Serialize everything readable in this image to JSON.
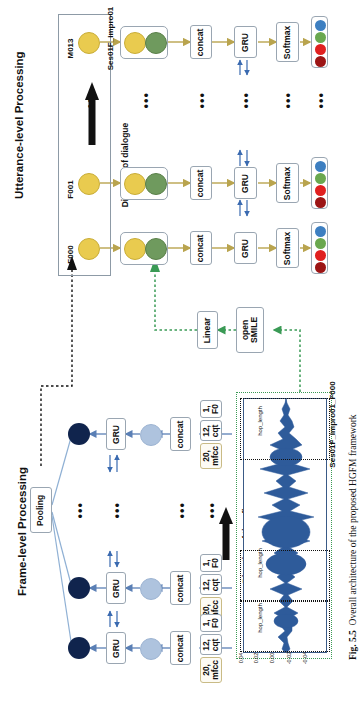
{
  "figure": {
    "caption_number": "Fig. 5.5",
    "caption_text": "Overall architecture of the proposed HGFM framework"
  },
  "sections": {
    "utterance": {
      "title": "Utterance-level Processing"
    },
    "frame": {
      "title": "Frame-level Processing"
    }
  },
  "dialogue": {
    "group_label": "Ses01F_impro01",
    "direction_label": "Direction of dialogue",
    "speakers": [
      "F000",
      "F001",
      "M013"
    ],
    "ellipsis": "•••"
  },
  "utterance_pipeline": {
    "concat_label": "concat",
    "gru_label": "GRU",
    "softmax_label": "Softmax",
    "output_dot_colors": [
      "#3d7fc1",
      "#6aa84f",
      "#e02020",
      "#9c1515"
    ]
  },
  "bridge": {
    "linear_label": "Linear",
    "opensmile_label_line1": "open",
    "opensmile_label_line2": "SMILE"
  },
  "frame_pipeline": {
    "pooling_label": "Pooling",
    "gru_label": "GRU",
    "concat_label": "concat",
    "features": [
      {
        "dim": "20,",
        "name": "mfcc"
      },
      {
        "dim": "12,",
        "name": "cqt"
      },
      {
        "dim": "1,",
        "name": "F0"
      }
    ]
  },
  "waveform": {
    "file_label": "Ses01F_impro01_F000",
    "direction_label": "Direction of time flow",
    "hop_label": "hop_length",
    "y_ticks": [
      "0.04",
      "0.02",
      "0.00",
      "-0.02",
      "-0.04"
    ],
    "trace_color": "#2e5b9a"
  },
  "colors": {
    "utterance_node": "#e9cb4f",
    "context_node": "#6f9a5e",
    "frame_node": "#10244d",
    "frame_feat_node": "#aec3de",
    "arrow_yellow": "#b9a44e",
    "arrow_blue": "#5a7fb5",
    "arrow_green": "#3a9a55",
    "arrow_black": "#111111"
  }
}
